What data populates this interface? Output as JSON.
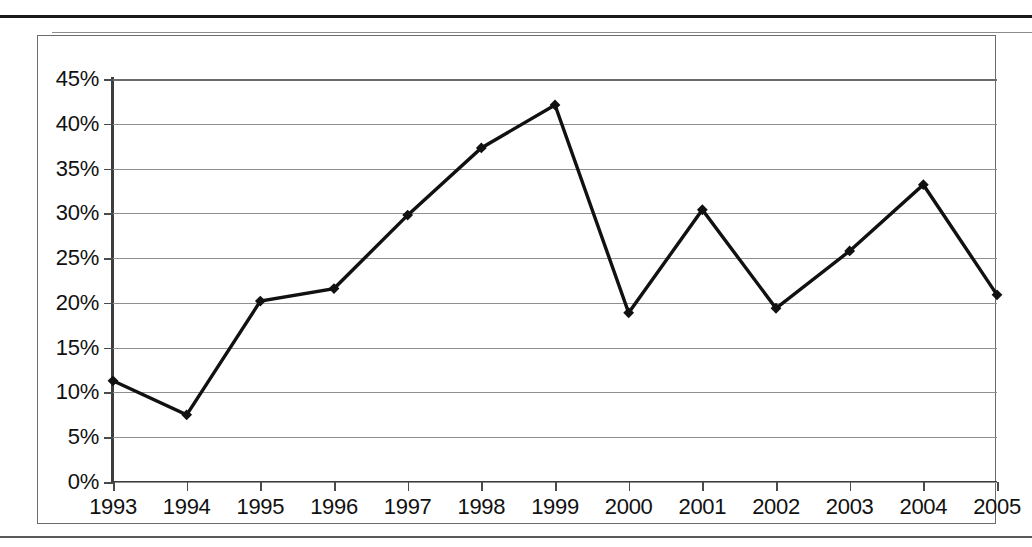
{
  "chart_data": {
    "type": "line",
    "title": "",
    "subtitle": "",
    "xlabel": "",
    "ylabel": "",
    "grid": true,
    "legend": false,
    "legend_position": "none",
    "xlim": [
      1993,
      2005
    ],
    "ylim": [
      0,
      45
    ],
    "ytick_labels": [
      "45%",
      "40%",
      "35%",
      "30%",
      "25%",
      "20%",
      "15%",
      "10%",
      "5%",
      "0%"
    ],
    "ytick_values": [
      45,
      40,
      35,
      30,
      25,
      20,
      15,
      10,
      5,
      0
    ],
    "categories": [
      "1993",
      "1994",
      "1995",
      "1996",
      "1997",
      "1998",
      "1999",
      "2000",
      "2001",
      "2002",
      "2003",
      "2004",
      "2005"
    ],
    "values": [
      11.3,
      7.5,
      20.2,
      21.6,
      29.8,
      37.3,
      42.1,
      18.9,
      30.4,
      19.4,
      25.8,
      33.2,
      20.9
    ],
    "series": [
      {
        "name": "series-1",
        "values": [
          11.3,
          7.5,
          20.2,
          21.6,
          29.8,
          37.3,
          42.1,
          18.9,
          30.4,
          19.4,
          25.8,
          33.2,
          20.9
        ],
        "color": "#111111",
        "marker": "diamond"
      }
    ],
    "annotations": []
  },
  "style": {
    "line_color": "#111111",
    "marker_color": "#111111",
    "grid_color": "#8f8f8f",
    "axis_color": "#3d3d3d",
    "frame_color": "#6b6b6b",
    "background": "#ffffff"
  }
}
